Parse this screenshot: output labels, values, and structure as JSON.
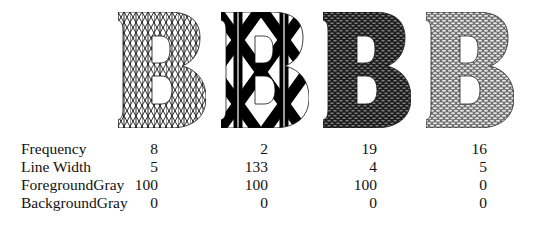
{
  "figure": {
    "glyph_letter": "B",
    "columns": [
      {
        "pattern_name": "triangular-crosshatch-fine",
        "frequency": "8",
        "line_width": "5",
        "foreground_gray": "100",
        "background_gray": "0"
      },
      {
        "pattern_name": "triangular-crosshatch-bold",
        "frequency": "2",
        "line_width": "133",
        "foreground_gray": "100",
        "background_gray": "0"
      },
      {
        "pattern_name": "dense-dark-weave",
        "frequency": "19",
        "line_width": "4",
        "foreground_gray": "100",
        "background_gray": "0"
      },
      {
        "pattern_name": "dense-light-weave",
        "frequency": "16",
        "line_width": "5",
        "foreground_gray": "0",
        "background_gray": "0"
      }
    ]
  },
  "table": {
    "rows": [
      {
        "label": "Frequency",
        "values": [
          "8",
          "2",
          "19",
          "16"
        ]
      },
      {
        "label": "Line Width",
        "values": [
          "5",
          "133",
          "4",
          "5"
        ]
      },
      {
        "label": "ForegroundGray",
        "values": [
          "100",
          "100",
          "100",
          "0"
        ]
      },
      {
        "label": "BackgroundGray",
        "values": [
          "0",
          "0",
          "0",
          "0"
        ]
      }
    ]
  },
  "colors": {
    "ink": "#111111",
    "paper": "#ffffff",
    "weave_dark": "#2a2a2a",
    "weave_light": "#9a9a9a"
  }
}
